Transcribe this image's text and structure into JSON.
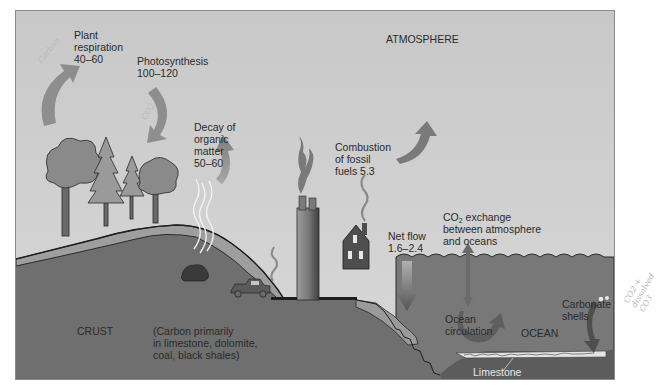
{
  "diagram": {
    "type": "carbon-cycle",
    "regions": {
      "atmosphere": "ATMOSPHERE",
      "crust": "CRUST",
      "ocean": "OCEAN"
    },
    "fluxes": [
      {
        "id": "plant_respiration",
        "lines": [
          "Plant",
          "respiration",
          "40–60"
        ],
        "direction": "up"
      },
      {
        "id": "photosynthesis",
        "lines": [
          "Photosynthesis",
          "100–120"
        ],
        "direction": "down"
      },
      {
        "id": "decay",
        "lines": [
          "Decay of",
          "organic",
          "matter",
          "50–60"
        ],
        "direction": "up"
      },
      {
        "id": "combustion",
        "lines": [
          "Combustion",
          "of fossil",
          "fuels 5.3"
        ],
        "direction": "up"
      },
      {
        "id": "net_flow",
        "lines": [
          "Net flow",
          "1.6–2.4"
        ],
        "direction": "down"
      },
      {
        "id": "co2_exchange",
        "lines_pre": "CO",
        "subscript": "2",
        "lines_post": " exchange",
        "lines": [
          "between atmosphere",
          "and oceans"
        ],
        "direction": "both"
      }
    ],
    "crust_note": [
      "(Carbon primarily",
      "in limestone, dolomite,",
      "coal, black shales)"
    ],
    "ocean_labels": {
      "circulation": [
        "Ocean",
        "circulation"
      ],
      "carbonate": [
        "Carbonate",
        "shells"
      ],
      "limestone": "Limestone"
    },
    "handwritten_notes": {
      "left_top": "Carbon",
      "arrow_note": "CO2",
      "right_margin": [
        "CO2 +",
        "dissolved",
        "CO3"
      ]
    },
    "colors": {
      "sky": "#d0d0d0",
      "ground": "#6e6e6e",
      "soil_layer": "#9a9a9a",
      "ocean": "#767676",
      "ocean_floor": "#5e5e5e",
      "arrow": "#8c8c8c",
      "frame_border": "#8a8a8a"
    }
  }
}
